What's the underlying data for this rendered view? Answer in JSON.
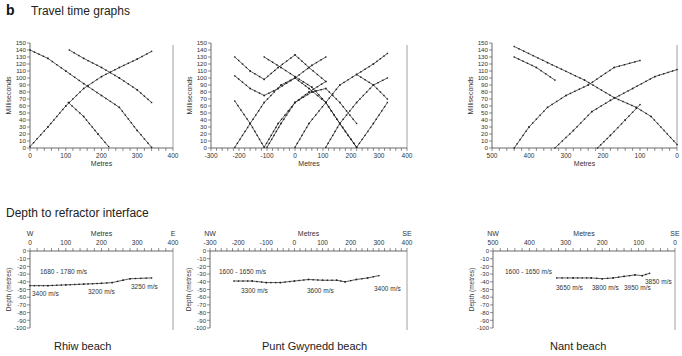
{
  "figure": {
    "letter": "b",
    "top_title": "Travel time graphs",
    "bottom_title": "Depth to refractor interface",
    "beaches": [
      "Rhiw beach",
      "Punt Gwynedd beach",
      "Nant beach"
    ]
  },
  "chart_data": [
    {
      "type": "line",
      "title": "Travel time graphs - Rhiw beach",
      "xlabel": "Metres",
      "ylabel": "Milliseconds",
      "xlim": [
        0,
        400
      ],
      "ylim": [
        0,
        150
      ],
      "xticks": [
        0,
        100,
        200,
        300,
        400
      ],
      "yticks": [
        0,
        10,
        20,
        30,
        40,
        50,
        60,
        70,
        80,
        90,
        100,
        110,
        120,
        130,
        140,
        150
      ],
      "series": [
        {
          "name": "forward from 0",
          "x": [
            0,
            50,
            100,
            150,
            200,
            250,
            300,
            340
          ],
          "y": [
            2,
            30,
            60,
            85,
            102,
            115,
            127,
            138
          ]
        },
        {
          "name": "reverse from 220",
          "x": [
            107,
            150,
            190,
            220
          ],
          "y": [
            65,
            45,
            20,
            2
          ]
        },
        {
          "name": "reverse from 340 (long)",
          "x": [
            0,
            50,
            100,
            150,
            200,
            250,
            300,
            340
          ],
          "y": [
            140,
            128,
            110,
            92,
            75,
            58,
            25,
            1
          ]
        },
        {
          "name": "reverse upper",
          "x": [
            110,
            150,
            200,
            250,
            300,
            340
          ],
          "y": [
            140,
            128,
            115,
            100,
            83,
            65
          ]
        }
      ]
    },
    {
      "type": "line",
      "title": "Travel time graphs - Punt Gwynedd beach",
      "xlabel": "Metres",
      "ylabel": "Milliseconds",
      "xlim": [
        -300,
        400
      ],
      "ylim": [
        0,
        150
      ],
      "xticks": [
        -300,
        -200,
        -100,
        0,
        100,
        200,
        300,
        400
      ],
      "yticks": [
        0,
        10,
        20,
        30,
        40,
        50,
        60,
        70,
        80,
        90,
        100,
        110,
        120,
        130,
        140,
        150
      ],
      "series": [
        {
          "name": "s1",
          "x": [
            -215,
            -160,
            -110,
            -60,
            0,
            50,
            110
          ],
          "y": [
            130,
            110,
            98,
            115,
            133,
            115,
            95
          ]
        },
        {
          "name": "s2",
          "x": [
            -215,
            -160,
            -110,
            -60,
            0,
            60,
            110
          ],
          "y": [
            103,
            85,
            75,
            85,
            100,
            118,
            130
          ]
        },
        {
          "name": "s3",
          "x": [
            -215,
            -160,
            -110,
            -60,
            0,
            50,
            110
          ],
          "y": [
            67,
            35,
            1,
            35,
            65,
            80,
            95
          ]
        },
        {
          "name": "s4",
          "x": [
            -215,
            -160,
            -110,
            -50,
            0,
            50,
            110
          ],
          "y": [
            1,
            35,
            65,
            90,
            100,
            85,
            65
          ]
        },
        {
          "name": "s5",
          "x": [
            -110,
            -50,
            0,
            60,
            110,
            160,
            220
          ],
          "y": [
            130,
            115,
            102,
            87,
            65,
            35,
            1
          ]
        },
        {
          "name": "s6",
          "x": [
            -100,
            -50,
            0,
            60,
            110,
            160,
            220
          ],
          "y": [
            1,
            35,
            65,
            80,
            85,
            65,
            35
          ]
        },
        {
          "name": "s7",
          "x": [
            0,
            50,
            110,
            160,
            220,
            280,
            330
          ],
          "y": [
            1,
            35,
            65,
            90,
            105,
            120,
            135
          ]
        },
        {
          "name": "s8",
          "x": [
            110,
            160,
            220,
            280,
            330
          ],
          "y": [
            65,
            35,
            1,
            35,
            65
          ]
        },
        {
          "name": "s9",
          "x": [
            110,
            160,
            220,
            280,
            330
          ],
          "y": [
            1,
            35,
            65,
            90,
            100
          ]
        },
        {
          "name": "s10",
          "x": [
            220,
            280,
            330
          ],
          "y": [
            105,
            90,
            70
          ]
        }
      ]
    },
    {
      "type": "line",
      "title": "Travel time graphs - Nant beach",
      "xlabel": "Metres",
      "ylabel": "Milliseconds",
      "xlim": [
        500,
        0
      ],
      "ylim": [
        0,
        150
      ],
      "xticks": [
        500,
        400,
        300,
        200,
        100,
        0
      ],
      "yticks": [
        0,
        10,
        20,
        30,
        40,
        50,
        60,
        70,
        80,
        90,
        100,
        110,
        120,
        130,
        140,
        150
      ],
      "series": [
        {
          "name": "reverse long",
          "x": [
            440,
            350,
            250,
            170,
            110,
            70,
            0
          ],
          "y": [
            145,
            122,
            97,
            72,
            58,
            45,
            5
          ]
        },
        {
          "name": "reverse short",
          "x": [
            440,
            380,
            330
          ],
          "y": [
            130,
            115,
            97
          ]
        },
        {
          "name": "forward from 440",
          "x": [
            440,
            400,
            350,
            300,
            240,
            170,
            100
          ],
          "y": [
            0,
            30,
            58,
            75,
            90,
            115,
            125
          ]
        },
        {
          "name": "forward from 330",
          "x": [
            330,
            280,
            230,
            180,
            120,
            60,
            0
          ],
          "y": [
            0,
            25,
            52,
            68,
            85,
            102,
            112
          ]
        },
        {
          "name": "forward from 215",
          "x": [
            215,
            180,
            140,
            100
          ],
          "y": [
            0,
            18,
            40,
            62
          ]
        }
      ]
    },
    {
      "type": "line",
      "title": "Depth to refractor interface - Rhiw beach",
      "xlabel": "Metres",
      "ylabel": "Depth (metres)",
      "left_label": "W",
      "right_label": "E",
      "xlim": [
        0,
        400
      ],
      "ylim": [
        -100,
        0
      ],
      "xticks": [
        0,
        100,
        200,
        300,
        400
      ],
      "yticks": [
        0,
        -10,
        -20,
        -30,
        -40,
        -50,
        -60,
        -70,
        -80,
        -90,
        -100
      ],
      "annotations": [
        "1680 - 1780 m/s",
        "3400 m/s",
        "3200 m/s",
        "3250 m/s"
      ],
      "series": [
        {
          "name": "refractor",
          "x": [
            0,
            50,
            100,
            150,
            200,
            230,
            260,
            280,
            340
          ],
          "y": [
            -45,
            -45,
            -44,
            -43,
            -42,
            -41,
            -38,
            -36,
            -35
          ]
        }
      ]
    },
    {
      "type": "line",
      "title": "Depth to refractor interface - Punt Gwynedd beach",
      "xlabel": "Metres",
      "ylabel": "Depth (metres)",
      "left_label": "NW",
      "right_label": "SE",
      "xlim": [
        -300,
        400
      ],
      "ylim": [
        -100,
        0
      ],
      "xticks": [
        -300,
        -200,
        -100,
        0,
        100,
        200,
        300,
        400
      ],
      "yticks": [
        0,
        -10,
        -20,
        -30,
        -40,
        -50,
        -60,
        -70,
        -80,
        -90,
        -100
      ],
      "annotations": [
        "1600 - 1650 m/s",
        "3300 m/s",
        "3600 m/s",
        "3400 m/s"
      ],
      "series": [
        {
          "name": "refractor",
          "x": [
            -215,
            -150,
            -100,
            -50,
            0,
            50,
            100,
            150,
            180,
            220,
            260,
            300
          ],
          "y": [
            -39,
            -39,
            -41,
            -41,
            -39,
            -37,
            -38,
            -38,
            -40,
            -37,
            -35,
            -32
          ]
        }
      ]
    },
    {
      "type": "line",
      "title": "Depth to refractor interface - Nant beach",
      "xlabel": "Metres",
      "ylabel": "Depth (metres)",
      "left_label": "NW",
      "right_label": "SE",
      "xlim": [
        500,
        0
      ],
      "ylim": [
        -100,
        0
      ],
      "xticks": [
        500,
        400,
        300,
        200,
        100,
        0
      ],
      "yticks": [
        0,
        -10,
        -20,
        -30,
        -40,
        -50,
        -60,
        -70,
        -80,
        -90,
        -100
      ],
      "annotations": [
        "1600 - 1650 m/s",
        "3650 m/s",
        "3800 m/s",
        "3950 m/s",
        "3850 m/s"
      ],
      "series": [
        {
          "name": "refractor",
          "x": [
            325,
            280,
            230,
            200,
            170,
            140,
            110,
            90,
            70
          ],
          "y": [
            -35,
            -35,
            -35,
            -36,
            -35,
            -33,
            -31,
            -32,
            -29
          ]
        }
      ]
    }
  ]
}
